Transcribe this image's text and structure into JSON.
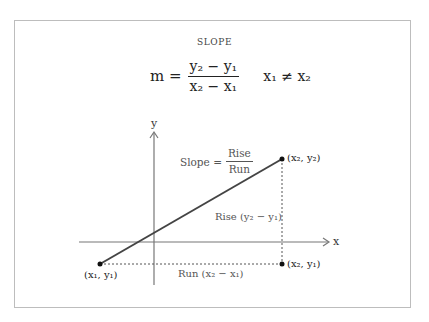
{
  "diagram": {
    "title": "SLOPE",
    "formula": {
      "lhs": "m =",
      "numerator": "y₂ − y₁",
      "denominator": "x₂ − x₁",
      "condition": "x₁ ≠ x₂"
    },
    "axes": {
      "x_label": "x",
      "y_label": "y"
    },
    "slope_label": {
      "prefix": "Slope =",
      "numerator": "Rise",
      "denominator": "Run"
    },
    "rise_label": "Rise (y₂ − y₁)",
    "run_label": "Run (x₂ − x₁)",
    "points": [
      {
        "label": "(x₁, y₁)"
      },
      {
        "label": "(x₂, y₂)"
      },
      {
        "label": "(x₂, y₁)"
      }
    ],
    "colors": {
      "line": "#444444",
      "axis": "#777777",
      "frame": "#bdbdbd"
    }
  }
}
